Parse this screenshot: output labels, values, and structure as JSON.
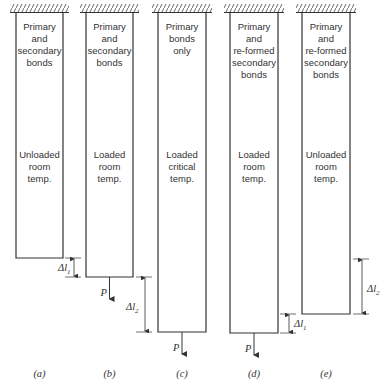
{
  "figure": {
    "bars": [
      {
        "id": "a",
        "caption": "(a)",
        "upper_text": [
          "Primary",
          "and",
          "secondary",
          "bonds"
        ],
        "lower_text": [
          "Unloaded",
          "room",
          "temp."
        ],
        "x_left": 16,
        "x_right": 63,
        "bottom": 258,
        "load": false
      },
      {
        "id": "b",
        "caption": "(b)",
        "upper_text": [
          "Primary",
          "and",
          "secondary",
          "bonds"
        ],
        "lower_text": [
          "Loaded",
          "room",
          "temp."
        ],
        "x_left": 86,
        "x_right": 133,
        "bottom": 277,
        "load": true
      },
      {
        "id": "c",
        "caption": "(c)",
        "upper_text": [
          "Primary",
          "bonds",
          "only"
        ],
        "lower_text": [
          "Loaded",
          "critical",
          "temp."
        ],
        "x_left": 158,
        "x_right": 206,
        "bottom": 332,
        "load": true
      },
      {
        "id": "d",
        "caption": "(d)",
        "upper_text": [
          "Primary",
          "and",
          "re-formed",
          "secondary",
          "bonds"
        ],
        "lower_text": [
          "Loaded",
          "room",
          "temp."
        ],
        "x_left": 230,
        "x_right": 278,
        "bottom": 333,
        "load": true
      },
      {
        "id": "e",
        "caption": "(e)",
        "upper_text": [
          "Primary",
          "and",
          "re-formed",
          "secondary",
          "bonds"
        ],
        "lower_text": [
          "Unloaded",
          "room",
          "temp."
        ],
        "x_left": 302,
        "x_right": 350,
        "bottom": 314,
        "load": false
      }
    ],
    "load_label": "P",
    "dimensions": [
      {
        "label_main": "Δl",
        "label_sub": "1",
        "x": 74,
        "y_top": 258,
        "y_bottom": 277,
        "label_x": 58,
        "label_y": 271
      },
      {
        "label_main": "Δl",
        "label_sub": "2",
        "x": 145,
        "y_top": 277,
        "y_bottom": 332,
        "label_x": 126,
        "label_y": 310
      },
      {
        "label_main": "Δl",
        "label_sub": "1",
        "x": 289,
        "y_top": 314,
        "y_bottom": 333,
        "label_x": 294,
        "label_y": 327
      },
      {
        "label_main": "Δl",
        "label_sub": "2",
        "x": 362,
        "y_top": 259,
        "y_bottom": 314,
        "label_x": 367,
        "label_y": 292
      }
    ],
    "colors": {
      "line": "#333333",
      "background": "#ffffff"
    }
  }
}
